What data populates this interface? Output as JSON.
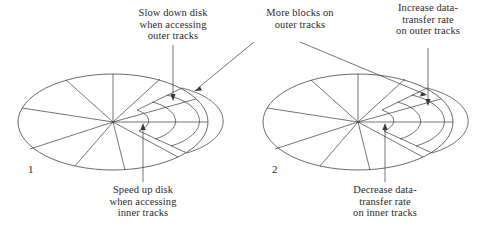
{
  "figure": {
    "type": "diagram",
    "background_color": "#ffffff",
    "line_color": "#3a3a3a",
    "text_color": "#2b2b2b"
  },
  "annotations": {
    "slow_down": "Slow down disk\nwhen accessing\nouter tracks",
    "more_blocks": "More blocks on\nouter tracks",
    "increase_rate": "Increase data-\ntransfer rate\non outer tracks",
    "speed_up": "Speed up disk\nwhen accessing\ninner tracks",
    "decrease_rate": "Decrease data-\ntransfer rate\non inner tracks"
  },
  "disks": {
    "left_label": "1",
    "right_label": "2"
  }
}
